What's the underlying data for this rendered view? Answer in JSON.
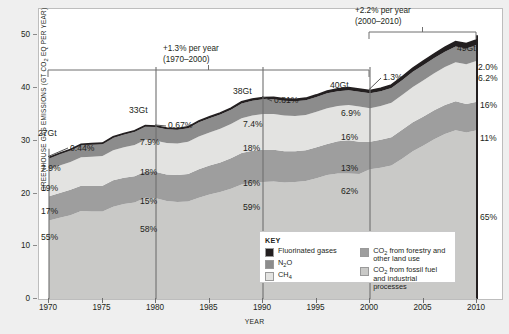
{
  "figure": {
    "ylabel": "GREENHOUSE GAS EMISSIONS (GT CO2 EQ PER YEAR)",
    "xlabel": "YEAR"
  },
  "key": {
    "title": "KEY",
    "items": [
      {
        "label": "Fluorinated gases",
        "color": "#231f20",
        "name": "fluorinated-gases"
      },
      {
        "label": "N2O",
        "color": "#8c8c8c",
        "name": "n2o"
      },
      {
        "label": "CH4",
        "color": "#e3e3e1",
        "name": "ch4"
      },
      {
        "label": "CO2 from forestry and other land use",
        "color": "#9e9e9e",
        "name": "co2-forestry"
      },
      {
        "label": "CO2 from fossil fuel and industrial processes",
        "color": "#c9c9c7",
        "name": "co2-fossil"
      }
    ]
  },
  "annotations": {
    "bracket1": {
      "line1": "+1.3% per year",
      "line2": "(1970–2000)"
    },
    "bracket2": {
      "line1": "+2.2% per year",
      "line2": "(2000–2010)"
    },
    "totals": [
      {
        "year": 1970,
        "label": "27Gt"
      },
      {
        "year": 1980,
        "label": "33Gt"
      },
      {
        "year": 1990,
        "label": "38Gt"
      },
      {
        "year": 2000,
        "label": "40Gt"
      },
      {
        "year": 2010,
        "label": "49Gt"
      }
    ],
    "callouts": [
      {
        "year": 1970,
        "label": "0.44%"
      },
      {
        "year": 1980,
        "label": "0.67%"
      },
      {
        "year": 1990,
        "label": "0.81%"
      },
      {
        "year": 2000,
        "label": "1.3%"
      }
    ],
    "shares_1970": [
      "7.9%",
      "19%",
      "17%",
      "55%"
    ],
    "shares_1980": [
      "7.9%",
      "18%",
      "15%",
      "58%"
    ],
    "shares_1990": [
      "7.4%",
      "18%",
      "16%",
      "59%"
    ],
    "shares_2000": [
      "6.9%",
      "16%",
      "13%",
      "62%"
    ],
    "shares_2010": [
      "2.0%",
      "6.2%",
      "16%",
      "11%",
      "65%"
    ]
  },
  "chart_data": {
    "type": "area",
    "title": "",
    "xlabel": "YEAR",
    "ylabel": "GREENHOUSE GAS EMISSIONS (GT CO2 EQ PER YEAR)",
    "xlim": [
      1970,
      2010
    ],
    "ylim": [
      0,
      55
    ],
    "yticks": [
      0,
      10,
      20,
      30,
      40,
      50
    ],
    "xticks": [
      1970,
      1975,
      1980,
      1985,
      1990,
      1995,
      2000,
      2005,
      2010
    ],
    "grid": false,
    "legend_position": "inside-bottom-center",
    "stacked": true,
    "x": [
      1970,
      1971,
      1972,
      1973,
      1974,
      1975,
      1976,
      1977,
      1978,
      1979,
      1980,
      1981,
      1982,
      1983,
      1984,
      1985,
      1986,
      1987,
      1988,
      1989,
      1990,
      1991,
      1992,
      1993,
      1994,
      1995,
      1996,
      1997,
      1998,
      1999,
      2000,
      2001,
      2002,
      2003,
      2004,
      2005,
      2006,
      2007,
      2008,
      2009,
      2010
    ],
    "series": [
      {
        "name": "CO2 from fossil fuel and industrial processes",
        "color": "#c9c9c7",
        "values": [
          14.9,
          15.4,
          15.9,
          16.7,
          16.6,
          16.6,
          17.5,
          18.0,
          18.3,
          19.2,
          19.1,
          18.6,
          18.4,
          18.5,
          19.2,
          19.8,
          20.3,
          20.9,
          21.7,
          22.0,
          22.2,
          22.3,
          22.1,
          22.2,
          22.4,
          22.9,
          23.5,
          23.8,
          23.8,
          23.7,
          24.6,
          24.9,
          25.3,
          26.6,
          28.0,
          29.1,
          30.3,
          31.3,
          32.0,
          31.6,
          32.0
        ]
      },
      {
        "name": "CO2 from forestry and other land use",
        "color": "#9e9e9e",
        "values": [
          4.6,
          4.7,
          4.8,
          4.8,
          4.9,
          4.9,
          5.0,
          5.0,
          5.0,
          5.0,
          5.0,
          5.0,
          5.1,
          5.2,
          5.4,
          5.5,
          5.6,
          5.8,
          6.0,
          6.1,
          6.1,
          6.0,
          5.9,
          5.8,
          5.8,
          5.9,
          5.9,
          6.1,
          6.3,
          6.1,
          5.2,
          5.3,
          5.4,
          5.5,
          5.5,
          5.5,
          5.5,
          5.5,
          5.5,
          5.4,
          5.4
        ]
      },
      {
        "name": "CH4",
        "color": "#e3e3e1",
        "values": [
          5.1,
          5.2,
          5.3,
          5.4,
          5.5,
          5.6,
          5.7,
          5.8,
          5.9,
          6.0,
          5.9,
          6.0,
          6.0,
          6.1,
          6.2,
          6.3,
          6.4,
          6.5,
          6.6,
          6.7,
          6.8,
          6.8,
          6.8,
          6.7,
          6.7,
          6.7,
          6.8,
          6.7,
          6.7,
          6.7,
          6.4,
          6.4,
          6.5,
          6.6,
          6.7,
          6.9,
          7.0,
          7.2,
          7.4,
          7.5,
          7.8
        ]
      },
      {
        "name": "N2O",
        "color": "#8c8c8c",
        "values": [
          2.1,
          2.2,
          2.2,
          2.3,
          2.3,
          2.3,
          2.4,
          2.4,
          2.5,
          2.5,
          2.6,
          2.6,
          2.6,
          2.6,
          2.7,
          2.7,
          2.7,
          2.7,
          2.8,
          2.8,
          2.8,
          2.8,
          2.8,
          2.8,
          2.8,
          2.8,
          2.8,
          2.8,
          2.8,
          2.8,
          2.8,
          2.8,
          2.8,
          2.8,
          2.9,
          2.9,
          2.9,
          2.9,
          3.0,
          3.0,
          3.0
        ]
      },
      {
        "name": "Fluorinated gases",
        "color": "#231f20",
        "values": [
          0.12,
          0.13,
          0.14,
          0.15,
          0.16,
          0.17,
          0.18,
          0.19,
          0.2,
          0.21,
          0.22,
          0.23,
          0.24,
          0.25,
          0.26,
          0.27,
          0.28,
          0.29,
          0.3,
          0.31,
          0.31,
          0.33,
          0.35,
          0.37,
          0.39,
          0.41,
          0.44,
          0.46,
          0.48,
          0.5,
          0.52,
          0.56,
          0.6,
          0.64,
          0.7,
          0.75,
          0.8,
          0.86,
          0.9,
          0.94,
          0.98
        ]
      }
    ],
    "totals_labeled": {
      "1970": 27,
      "1980": 33,
      "1990": 38,
      "2000": 40,
      "2010": 49
    },
    "growth_periods": [
      {
        "range": [
          1970,
          2000
        ],
        "rate": "+1.3% per year"
      },
      {
        "range": [
          2000,
          2010
        ],
        "rate": "+2.2% per year"
      }
    ],
    "shares_pct": {
      "1970": {
        "Fluorinated gases": 0.44,
        "N2O": 7.9,
        "CH4": 19,
        "CO2 forestry": 17,
        "CO2 fossil": 55
      },
      "1980": {
        "Fluorinated gases": 0.67,
        "N2O": 7.9,
        "CH4": 18,
        "CO2 forestry": 15,
        "CO2 fossil": 58
      },
      "1990": {
        "Fluorinated gases": 0.81,
        "N2O": 7.4,
        "CH4": 18,
        "CO2 forestry": 16,
        "CO2 fossil": 59
      },
      "2000": {
        "Fluorinated gases": 1.3,
        "N2O": 6.9,
        "CH4": 16,
        "CO2 forestry": 13,
        "CO2 fossil": 62
      },
      "2010": {
        "Fluorinated gases": 2.0,
        "N2O": 6.2,
        "CH4": 16,
        "CO2 forestry": 11,
        "CO2 fossil": 65
      }
    }
  }
}
